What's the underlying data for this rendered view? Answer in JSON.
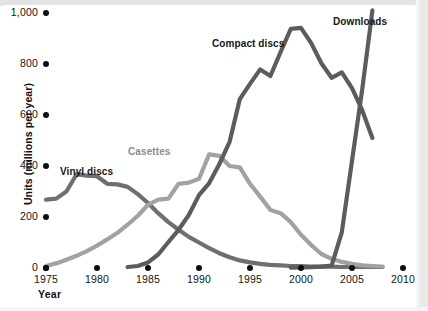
{
  "chart_data": {
    "type": "line",
    "title": "",
    "xlabel": "Year",
    "ylabel": "Units (millions per year)",
    "xlim": [
      1975,
      2010
    ],
    "ylim": [
      0,
      1000
    ],
    "xticks": [
      "1975",
      "1980",
      "1985",
      "1990",
      "1995",
      "2000",
      "2005",
      "2010"
    ],
    "yticks": [
      "0",
      "200",
      "400",
      "600",
      "800",
      "1,000"
    ],
    "grid": false,
    "legend": "inline-labels",
    "series": [
      {
        "name": "Vinyl discs",
        "color": "#6f6f6f",
        "label_x": 60,
        "label_y": 166,
        "x": [
          1975,
          1976,
          1977,
          1978,
          1979,
          1980,
          1981,
          1982,
          1983,
          1984,
          1985,
          1986,
          1987,
          1988,
          1989,
          1990,
          1991,
          1992,
          1993,
          1994,
          1995,
          1996,
          1997,
          1998,
          1999,
          2000,
          2001,
          2002,
          2003,
          2004,
          2005,
          2006,
          2007,
          2008
        ],
        "y": [
          268,
          272,
          300,
          368,
          362,
          360,
          330,
          328,
          318,
          290,
          255,
          215,
          180,
          150,
          122,
          100,
          78,
          58,
          42,
          30,
          22,
          16,
          12,
          10,
          8,
          7,
          6,
          5,
          5,
          4,
          4,
          4,
          4,
          4
        ]
      },
      {
        "name": "Casettes",
        "color": "#a2a2a2",
        "label_x": 128,
        "label_y": 146,
        "x": [
          1975,
          1976,
          1977,
          1978,
          1979,
          1980,
          1981,
          1982,
          1983,
          1984,
          1985,
          1986,
          1987,
          1988,
          1989,
          1990,
          1991,
          1992,
          1993,
          1994,
          1995,
          1996,
          1997,
          1998,
          1999,
          2000,
          2001,
          2002,
          2003,
          2004,
          2005,
          2006,
          2007,
          2008
        ],
        "y": [
          8,
          18,
          32,
          48,
          66,
          88,
          112,
          138,
          170,
          205,
          248,
          268,
          272,
          330,
          335,
          350,
          446,
          440,
          400,
          395,
          330,
          280,
          228,
          215,
          180,
          130,
          90,
          55,
          36,
          24,
          16,
          10,
          8,
          6
        ]
      },
      {
        "name": "Compact discs",
        "color": "#5c5c5c",
        "label_x": 212,
        "label_y": 38,
        "x": [
          1983,
          1984,
          1985,
          1986,
          1987,
          1988,
          1989,
          1990,
          1991,
          1992,
          1993,
          1994,
          1995,
          1996,
          1997,
          1998,
          1999,
          2000,
          2001,
          2002,
          2003,
          2004,
          2005,
          2006,
          2007
        ],
        "y": [
          4,
          8,
          22,
          53,
          102,
          150,
          208,
          286,
          333,
          408,
          495,
          662,
          722,
          779,
          753,
          847,
          938,
          942,
          882,
          803,
          746,
          767,
          705,
          619,
          510
        ]
      },
      {
        "name": "Downloads",
        "color": "#5c5c5c",
        "label_x": 333,
        "label_y": 16,
        "x": [
          1999,
          2000,
          2001,
          2002,
          2003,
          2004,
          2005,
          2006,
          2007
        ],
        "y": [
          1,
          2,
          3,
          5,
          9,
          140,
          420,
          700,
          1010
        ]
      }
    ]
  }
}
